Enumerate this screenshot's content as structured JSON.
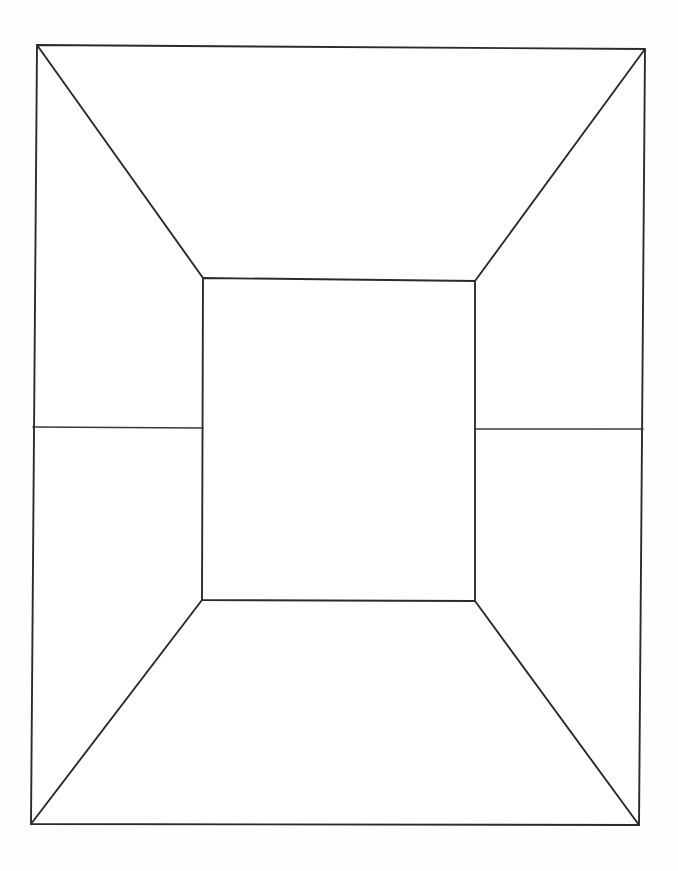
{
  "document": {
    "title": "One-Point Perspective Box",
    "medium": "pen line drawing on white paper",
    "background_color": "#fefefe",
    "line_color": "#2b2b2b",
    "canvas_width": 678,
    "canvas_height": 871
  },
  "figure": {
    "name": "perspective-box",
    "description": "One-point perspective interior box: outer rectangle, inner rectangle, four corner diagonals, and two side horizontal lines.",
    "outer_rectangle": {
      "name": "outer-rectangle",
      "points": "37,45 645,49 639,825 31,824",
      "top_left": [
        37,
        45
      ],
      "top_right": [
        645,
        49
      ],
      "bottom_right": [
        639,
        825
      ],
      "bottom_left": [
        31,
        824
      ]
    },
    "inner_rectangle": {
      "name": "inner-rectangle",
      "points": "203,278 475,281 475,601 202,600",
      "top_left": [
        203,
        278
      ],
      "top_right": [
        475,
        281
      ],
      "bottom_right": [
        475,
        601
      ],
      "bottom_left": [
        202,
        600
      ]
    },
    "diagonals": [
      {
        "name": "diagonal-top-left",
        "x1": 37,
        "y1": 45,
        "x2": 203,
        "y2": 278
      },
      {
        "name": "diagonal-top-right",
        "x1": 645,
        "y1": 49,
        "x2": 475,
        "y2": 281
      },
      {
        "name": "diagonal-bottom-right",
        "x1": 639,
        "y1": 825,
        "x2": 475,
        "y2": 601
      },
      {
        "name": "diagonal-bottom-left",
        "x1": 31,
        "y1": 824,
        "x2": 202,
        "y2": 600
      }
    ],
    "side_lines": [
      {
        "name": "left-horizontal-line",
        "x1": 33,
        "y1": 427,
        "x2": 203,
        "y2": 428
      },
      {
        "name": "right-horizontal-line",
        "x1": 475,
        "y1": 429,
        "x2": 643,
        "y2": 429
      }
    ]
  },
  "chart_data": {
    "type": "diagram",
    "title": "One-Point Perspective Box",
    "subtitle": "",
    "shapes": [
      {
        "id": "outer-rectangle",
        "kind": "quadrilateral",
        "vertices": [
          [
            37,
            45
          ],
          [
            645,
            49
          ],
          [
            639,
            825
          ],
          [
            31,
            824
          ]
        ],
        "closed": true,
        "stroke": "#2b2b2b",
        "fill": "none"
      },
      {
        "id": "inner-rectangle",
        "kind": "quadrilateral",
        "vertices": [
          [
            203,
            278
          ],
          [
            475,
            281
          ],
          [
            475,
            601
          ],
          [
            202,
            600
          ]
        ],
        "closed": true,
        "stroke": "#2b2b2b",
        "fill": "none"
      },
      {
        "id": "diagonal-top-left",
        "kind": "line",
        "vertices": [
          [
            37,
            45
          ],
          [
            203,
            278
          ]
        ],
        "stroke": "#2b2b2b"
      },
      {
        "id": "diagonal-top-right",
        "kind": "line",
        "vertices": [
          [
            645,
            49
          ],
          [
            475,
            281
          ]
        ],
        "stroke": "#2b2b2b"
      },
      {
        "id": "diagonal-bottom-right",
        "kind": "line",
        "vertices": [
          [
            639,
            825
          ],
          [
            475,
            601
          ]
        ],
        "stroke": "#2b2b2b"
      },
      {
        "id": "diagonal-bottom-left",
        "kind": "line",
        "vertices": [
          [
            31,
            824
          ],
          [
            202,
            600
          ]
        ],
        "stroke": "#2b2b2b"
      },
      {
        "id": "left-horizontal-line",
        "kind": "line",
        "vertices": [
          [
            33,
            427
          ],
          [
            203,
            428
          ]
        ],
        "stroke": "#2b2b2b"
      },
      {
        "id": "right-horizontal-line",
        "kind": "line",
        "vertices": [
          [
            475,
            429
          ],
          [
            643,
            429
          ]
        ],
        "stroke": "#2b2b2b"
      }
    ],
    "regions": [
      {
        "id": "ceiling-face",
        "label": "",
        "vertices": [
          [
            37,
            45
          ],
          [
            645,
            49
          ],
          [
            475,
            281
          ],
          [
            203,
            278
          ]
        ]
      },
      {
        "id": "left-wall-face",
        "label": "",
        "vertices": [
          [
            37,
            45
          ],
          [
            203,
            278
          ],
          [
            202,
            600
          ],
          [
            31,
            824
          ]
        ]
      },
      {
        "id": "right-wall-face",
        "label": "",
        "vertices": [
          [
            645,
            49
          ],
          [
            639,
            825
          ],
          [
            475,
            601
          ],
          [
            475,
            281
          ]
        ]
      },
      {
        "id": "floor-face",
        "label": "",
        "vertices": [
          [
            31,
            824
          ],
          [
            202,
            600
          ],
          [
            475,
            601
          ],
          [
            639,
            825
          ]
        ]
      },
      {
        "id": "back-wall-face",
        "label": "",
        "vertices": [
          [
            203,
            278
          ],
          [
            475,
            281
          ],
          [
            475,
            601
          ],
          [
            202,
            600
          ]
        ]
      }
    ],
    "annotations": [],
    "legend": [],
    "grid": false,
    "axis_visible": false
  }
}
